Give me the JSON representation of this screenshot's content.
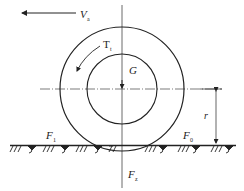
{
  "diagram": {
    "labels": {
      "velocity": {
        "main": "V",
        "sub": "a"
      },
      "torque": {
        "main": "T",
        "sub": "t"
      },
      "weight": {
        "main": "G"
      },
      "friction_left": {
        "main": "F",
        "sub": "1"
      },
      "friction_right": {
        "main": "F",
        "sub": "0"
      },
      "normal_force": {
        "main": "F",
        "sub": "z"
      },
      "radius": {
        "main": "r"
      }
    },
    "colors": {
      "stroke": "#222222",
      "background": "#ffffff"
    }
  }
}
